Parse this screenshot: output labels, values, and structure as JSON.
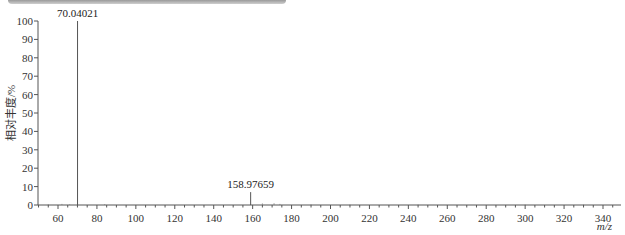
{
  "chart_data": {
    "type": "bar",
    "subtype": "mass-spectrum",
    "title": "",
    "xlabel": "m/z",
    "ylabel": "相对丰度/%",
    "xlim": [
      50,
      350
    ],
    "ylim": [
      0,
      100
    ],
    "x_ticks": [
      60,
      80,
      100,
      120,
      140,
      160,
      180,
      200,
      220,
      240,
      260,
      280,
      300,
      320,
      340
    ],
    "y_ticks": [
      0,
      10,
      20,
      30,
      40,
      50,
      60,
      70,
      80,
      90,
      100
    ],
    "grid": false,
    "legend": null,
    "peaks": [
      {
        "mz": 70.04021,
        "intensity": 100,
        "label": "70.04021"
      },
      {
        "mz": 158.97659,
        "intensity": 7,
        "label": "158.97659"
      }
    ],
    "minor_peaks": [
      {
        "mz": 55,
        "intensity": 0.5
      },
      {
        "mz": 62,
        "intensity": 0.6
      },
      {
        "mz": 66,
        "intensity": 0.4
      },
      {
        "mz": 84,
        "intensity": 0.5
      },
      {
        "mz": 165,
        "intensity": 0.8
      },
      {
        "mz": 171,
        "intensity": 0.9
      },
      {
        "mz": 174,
        "intensity": 0.6
      },
      {
        "mz": 190,
        "intensity": 0.4
      },
      {
        "mz": 210,
        "intensity": 0.3
      },
      {
        "mz": 245,
        "intensity": 0.3
      },
      {
        "mz": 300,
        "intensity": 0.3
      },
      {
        "mz": 330,
        "intensity": 0.3
      }
    ]
  },
  "labels": {
    "peak_1": "70.04021",
    "peak_2": "158.97659",
    "x_axis_title": "m/z",
    "y_axis_title": "相对丰度/%"
  }
}
